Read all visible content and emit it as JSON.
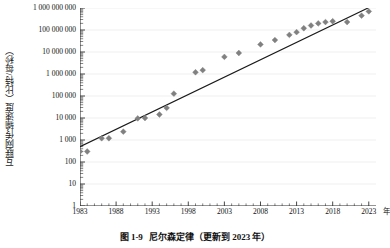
{
  "caption": {
    "number": "图 1-9",
    "text": "尼尔森定律（更新到 2023 年）"
  },
  "axis": {
    "y_title": "互联网传输速度（比特/每秒）",
    "x_unit": "年"
  },
  "colors": {
    "marker": "#808080",
    "trendline": "#1a1a1a",
    "gridline": "#e8e8e8",
    "axis": "#333333",
    "background": "#ffffff"
  },
  "chart_data": {
    "type": "scatter",
    "title": "尼尔森定律（更新到 2023 年）",
    "xlabel": "年",
    "ylabel": "互联网传输速度（比特/每秒）",
    "yscale": "log",
    "xlim": [
      1983,
      2024
    ],
    "ylim": [
      1,
      1000000000
    ],
    "grid": true,
    "legend": false,
    "ytick_labels": [
      "1",
      "10",
      "100",
      "1 000",
      "10 000",
      "100 000",
      "1 000 000",
      "10 000 000",
      "100 000 000",
      "1 000 000 000"
    ],
    "ytick_values": [
      1,
      10,
      100,
      1000,
      10000,
      100000,
      1000000,
      10000000,
      100000000,
      1000000000
    ],
    "xtick_labels": [
      "1983",
      "1988",
      "1993",
      "1998",
      "2003",
      "2008",
      "2013",
      "2018",
      "2023"
    ],
    "xtick_values": [
      1983,
      1988,
      1993,
      1998,
      2003,
      2008,
      2013,
      2018,
      2023
    ],
    "minor_ticks": "yearly",
    "series": [
      {
        "name": "互联网传输速度",
        "marker": "diamond",
        "color": "#808080",
        "points": [
          {
            "x": 1983,
            "y": 300
          },
          {
            "x": 1984,
            "y": 300
          },
          {
            "x": 1986,
            "y": 1200
          },
          {
            "x": 1987,
            "y": 1200
          },
          {
            "x": 1989,
            "y": 2400
          },
          {
            "x": 1991,
            "y": 9600
          },
          {
            "x": 1992,
            "y": 10000
          },
          {
            "x": 1994,
            "y": 14400
          },
          {
            "x": 1995,
            "y": 28800
          },
          {
            "x": 1996,
            "y": 128000
          },
          {
            "x": 1999,
            "y": 1200000
          },
          {
            "x": 2000,
            "y": 1500000
          },
          {
            "x": 2003,
            "y": 6000000
          },
          {
            "x": 2005,
            "y": 9000000
          },
          {
            "x": 2008,
            "y": 22000000
          },
          {
            "x": 2010,
            "y": 35000000
          },
          {
            "x": 2012,
            "y": 60000000
          },
          {
            "x": 2013,
            "y": 80000000
          },
          {
            "x": 2014,
            "y": 120000000
          },
          {
            "x": 2015,
            "y": 160000000
          },
          {
            "x": 2016,
            "y": 200000000
          },
          {
            "x": 2017,
            "y": 230000000
          },
          {
            "x": 2018,
            "y": 250000000
          },
          {
            "x": 2020,
            "y": 230000000
          },
          {
            "x": 2022,
            "y": 450000000
          },
          {
            "x": 2023,
            "y": 700000000
          }
        ]
      }
    ],
    "trendline": {
      "type": "exponential",
      "from": {
        "x": 1983,
        "y": 500
      },
      "to": {
        "x": 2024,
        "y": 1500000000
      },
      "annual_growth_rate": 0.5
    }
  }
}
